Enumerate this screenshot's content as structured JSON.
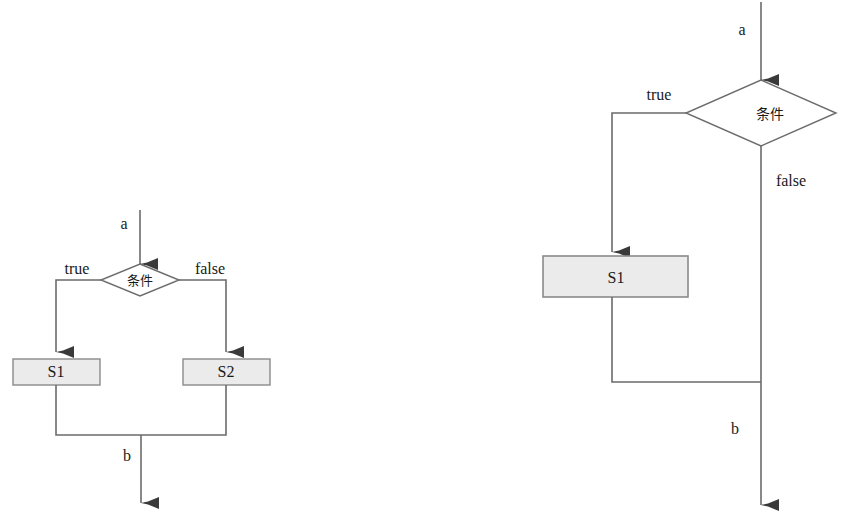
{
  "figure": {
    "type": "flowchart-diagram-pair",
    "background_color": "#ffffff",
    "stroke_color": "#6b6b6b",
    "arrow_color": "#3a3a3a",
    "node_fill_color": "#ebebeb",
    "node_border_color": "#8a8a8a",
    "text_color": "#1a1a1a"
  },
  "diagrams": [
    {
      "id": "if-else",
      "name": "if-else-flowchart",
      "entry_label": "a",
      "exit_label": "b",
      "decision": {
        "label": "条件",
        "shape": "diamond"
      },
      "branches": [
        {
          "label": "true",
          "target": "S1"
        },
        {
          "label": "false",
          "target": "S2"
        }
      ],
      "process_nodes": [
        {
          "label": "S1",
          "shape": "rectangle"
        },
        {
          "label": "S2",
          "shape": "rectangle"
        }
      ]
    },
    {
      "id": "if-then",
      "name": "if-then-flowchart",
      "entry_label": "a",
      "exit_label": "b",
      "decision": {
        "label": "条件",
        "shape": "diamond"
      },
      "branches": [
        {
          "label": "true",
          "target": "S1"
        },
        {
          "label": "false",
          "target": "b"
        }
      ],
      "process_nodes": [
        {
          "label": "S1",
          "shape": "rectangle"
        }
      ]
    }
  ],
  "labels": {
    "left_entry_a": "a",
    "left_true": "true",
    "left_false": "false",
    "left_condition": "条件",
    "left_s1": "S1",
    "left_s2": "S2",
    "left_exit_b": "b",
    "right_entry_a": "a",
    "right_true": "true",
    "right_false": "false",
    "right_condition": "条件",
    "right_s1": "S1",
    "right_exit_b": "b"
  }
}
